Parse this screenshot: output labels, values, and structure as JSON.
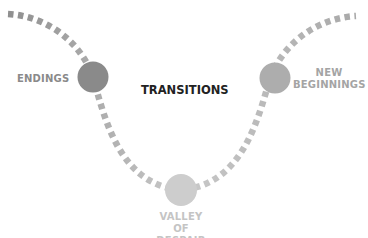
{
  "diagram": {
    "title": "TRANSITIONS",
    "stages": [
      {
        "id": "endings",
        "label_lines": [
          "ENDINGS"
        ],
        "color": "#8a8a8a",
        "text_color": "#8a8a8a"
      },
      {
        "id": "valley",
        "label_lines": [
          "VALLEY OF",
          "DESPAIR"
        ],
        "color": "#cdcdcd",
        "text_color": "#c4c4c4"
      },
      {
        "id": "new-beginnings",
        "label_lines": [
          "NEW",
          "BEGINNINGS"
        ],
        "color": "#adadad",
        "text_color": "#a4a4a4"
      }
    ],
    "path_style": {
      "type": "dashed-curve",
      "shape": "U",
      "color_dark": "#8f8f8f",
      "color_light": "#cccccc"
    }
  }
}
